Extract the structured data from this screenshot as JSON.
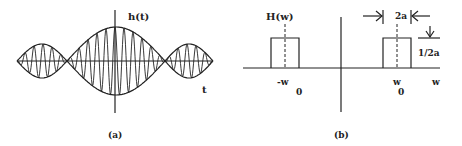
{
  "panel_a": {
    "caption": "(a)",
    "y_label": "h(t)",
    "x_label": "t",
    "description": "Modulated cosine: high-frequency carrier with sinc-like envelope; main lobe centered at t=0 and smaller side lobes"
  },
  "panel_b": {
    "caption": "(b)",
    "y_label": "H(w)",
    "x_label": "w",
    "left_center_label": "-w",
    "left_center_sub": "0",
    "right_center_label": "w",
    "right_center_sub": "0",
    "width_label": "2a",
    "height_label": "1/2a",
    "description": "Two rectangular pulses of width 2a and height 1/2a centered at -w0 and w0"
  },
  "colors": {
    "stroke": "#222222",
    "background": "#ffffff"
  }
}
